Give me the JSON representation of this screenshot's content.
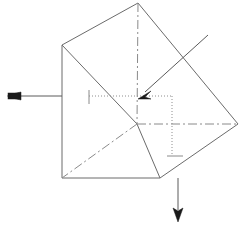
{
  "figure": {
    "background_color": "#ffffff",
    "width": 247,
    "height": 231,
    "solid_edge_color": "#6b6b6b",
    "hidden_edge_color": "#8a8a8a",
    "dotted_edge_color": "#8e8e8e",
    "arrow_color": "#1a1a1a"
  },
  "geometry": {
    "vertices": {
      "top": [
        138,
        3
      ],
      "left_upper": [
        62,
        45
      ],
      "right_upper": [
        214,
        45
      ],
      "left_lower": [
        62,
        178
      ],
      "right_lower": [
        160,
        178
      ],
      "right_mid": [
        238,
        124
      ],
      "center": [
        137,
        124
      ],
      "front_bottom_right": [
        160,
        178
      ]
    },
    "solid_edges": [
      {
        "name": "top-to-left-upper",
        "from": [
          138,
          3
        ],
        "to": [
          62,
          45
        ]
      },
      {
        "name": "left-upper-to-left-lower",
        "from": [
          62,
          45
        ],
        "to": [
          62,
          178
        ]
      },
      {
        "name": "left-lower-to-right-lower",
        "from": [
          62,
          178
        ],
        "to": [
          160,
          178
        ]
      },
      {
        "name": "left-upper-to-center",
        "from": [
          62,
          45
        ],
        "to": [
          137,
          124
        ]
      },
      {
        "name": "center-to-right-lower",
        "from": [
          137,
          124
        ],
        "to": [
          160,
          178
        ]
      },
      {
        "name": "top-to-right-mid",
        "from": [
          138,
          3
        ],
        "to": [
          238,
          124
        ]
      },
      {
        "name": "right-mid-to-right-lower",
        "from": [
          238,
          124
        ],
        "to": [
          160,
          178
        ]
      }
    ],
    "hidden_edges": [
      {
        "name": "vertical-axis",
        "from": [
          138,
          3
        ],
        "to": [
          137,
          124
        ]
      },
      {
        "name": "horizontal-axis",
        "from": [
          137,
          124
        ],
        "to": [
          238,
          124
        ]
      },
      {
        "name": "diagonal-axis",
        "from": [
          137,
          124
        ],
        "to": [
          62,
          178
        ]
      }
    ],
    "dotted_edges": [
      {
        "name": "projection-top",
        "from": [
          137,
          96
        ],
        "to": [
          172,
          96
        ]
      },
      {
        "name": "projection-right",
        "from": [
          172,
          96
        ],
        "to": [
          172,
          156
        ]
      },
      {
        "name": "projection-left-lead",
        "from": [
          89,
          96
        ],
        "to": [
          137,
          96
        ]
      }
    ],
    "tick_marks": [
      {
        "name": "vertical-tick-left",
        "from": [
          89,
          90
        ],
        "to": [
          89,
          104
        ]
      },
      {
        "name": "horizontal-tick-bottom",
        "from": [
          167,
          156
        ],
        "to": [
          183,
          156
        ]
      }
    ]
  },
  "arrows": [
    {
      "name": "left-load-arrow",
      "label": "",
      "direction": "left",
      "shaft_from": [
        62,
        96
      ],
      "shaft_to": [
        20,
        96
      ],
      "head_at": [
        9,
        96
      ],
      "head_style": "solid-block"
    },
    {
      "name": "diagonal-load-arrow",
      "label": "",
      "direction": "down-left",
      "shaft_from": [
        208,
        35
      ],
      "shaft_to": [
        145,
        92
      ],
      "head_at": [
        139,
        98
      ],
      "head_style": "solid-barbed"
    },
    {
      "name": "bottom-load-arrow",
      "label": "",
      "direction": "down",
      "shaft_from": [
        178,
        178
      ],
      "shaft_to": [
        178,
        210
      ],
      "head_at": [
        178,
        221
      ],
      "head_style": "solid-barbed"
    }
  ]
}
